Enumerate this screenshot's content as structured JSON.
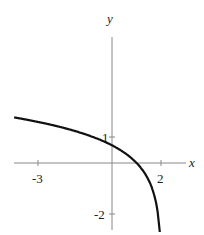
{
  "chart_data": {
    "type": "line",
    "title": "",
    "function": "y = ln(2 - x)",
    "xlabel": "x",
    "ylabel": "y",
    "xlim": [
      -3.9,
      2.4
    ],
    "ylim": [
      -2.3,
      3.4
    ],
    "x_ticks": [
      {
        "value": -3,
        "label": "-3"
      },
      {
        "value": 2,
        "label": "2"
      }
    ],
    "y_ticks": [
      {
        "value": 1,
        "label": "1"
      },
      {
        "value": -2,
        "label": "-2"
      }
    ],
    "series": [
      {
        "name": "curve",
        "x": [
          -3.9,
          -3,
          -2,
          -1,
          0,
          0.5,
          1,
          1.5,
          1.8,
          1.9,
          1.95
        ],
        "y": [
          1.77,
          1.61,
          1.39,
          1.1,
          0.69,
          0.41,
          0.0,
          -0.69,
          -1.61,
          -2.3,
          -2.3
        ]
      }
    ],
    "vertical_asymptote": 2,
    "grid": false
  },
  "labels": {
    "x_axis": "x",
    "y_axis": "y",
    "tick_x_neg3": "-3",
    "tick_x_2": "2",
    "tick_y_1": "1",
    "tick_y_neg2": "-2"
  }
}
